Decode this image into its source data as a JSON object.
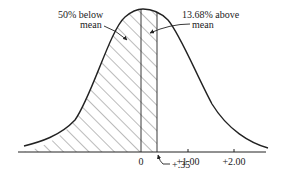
{
  "diagram": {
    "type": "normal-distribution-curve",
    "annotations": {
      "below_mean_line1": "50% below",
      "below_mean_line2": "mean",
      "above_mean_line1": "13.68% above",
      "above_mean_line2": "mean",
      "z_marker": "+.35"
    },
    "axis": {
      "ticks": [
        "0",
        "+1.00",
        "+2.00"
      ]
    },
    "shaded_region": {
      "from": "-inf",
      "to": "+.35",
      "pattern": "diagonal-hatch"
    },
    "colors": {
      "stroke": "#222222",
      "hatch": "#555555",
      "background": "#ffffff"
    }
  }
}
